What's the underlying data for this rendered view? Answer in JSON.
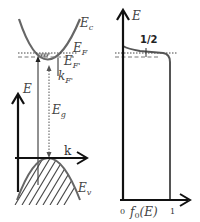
{
  "diagram": {
    "left_panel": {
      "title": "band-structure",
      "labels": {
        "conduction_band": "E",
        "conduction_band_sub": "c",
        "fermi_level": "E",
        "fermi_level_sub": "F",
        "fermi_level_prime": "E",
        "fermi_level_prime_sub": "F'",
        "fermi_wavevector": "k",
        "fermi_wavevector_sub": "F'",
        "energy_axis": "E",
        "band_gap": "E",
        "band_gap_sub": "g",
        "k_axis": "k",
        "valence_band": "E",
        "valence_band_sub": "v"
      }
    },
    "right_panel": {
      "title": "fermi-dirac-distribution",
      "labels": {
        "energy_axis": "E",
        "half_marker": "1/2",
        "x_axis": "f",
        "x_axis_sub": "0",
        "x_axis_arg": "(E)",
        "tick_zero": "0",
        "tick_one": "1"
      }
    },
    "colors": {
      "axis": "#111111",
      "curve": "#555555",
      "filled_region": "#bbbbbb",
      "label": "#444444"
    }
  }
}
